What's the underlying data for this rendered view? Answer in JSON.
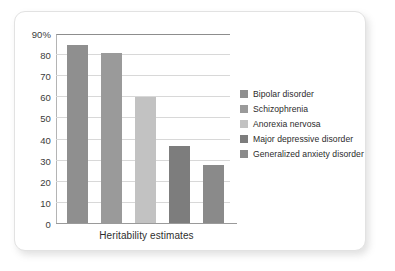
{
  "chart_data": {
    "type": "bar",
    "title": "",
    "xlabel": "Heritability estimates",
    "ylabel": "",
    "categories": [
      "Bipolar disorder",
      "Schizophrenia",
      "Anorexia nervosa",
      "Major depressive disorder",
      "Generalized anxiety disorder"
    ],
    "values": [
      85,
      81,
      60,
      37,
      28
    ],
    "colors": [
      "#8f8f8f",
      "#9a9a9a",
      "#c2c2c2",
      "#7d7d7d",
      "#8a8a8a"
    ],
    "ylim": [
      0,
      90
    ],
    "yticks": [
      0,
      10,
      20,
      30,
      40,
      50,
      60,
      70,
      80,
      90
    ],
    "ytick_labels": [
      "0",
      "10",
      "20",
      "30",
      "40",
      "50",
      "60",
      "70",
      "80",
      "90%"
    ],
    "grid": true,
    "legend_position": "right",
    "legend": [
      {
        "label": "Bipolar disorder",
        "color": "#8f8f8f"
      },
      {
        "label": "Schizophrenia",
        "color": "#9a9a9a"
      },
      {
        "label": "Anorexia nervosa",
        "color": "#c2c2c2"
      },
      {
        "label": "Major depressive disorder",
        "color": "#7d7d7d"
      },
      {
        "label": "Generalized anxiety disorder",
        "color": "#8a8a8a"
      }
    ]
  }
}
